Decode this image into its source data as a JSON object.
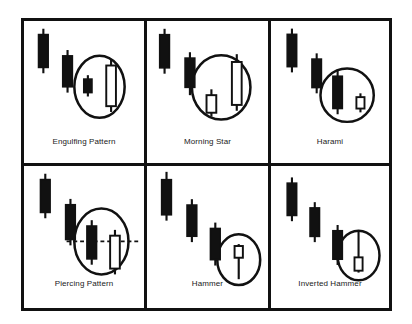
{
  "figure": {
    "background_color": "#ffffff",
    "ink_color": "#111111",
    "layout": {
      "columns": 3,
      "rows": 2,
      "cells": 6
    }
  },
  "cells": [
    {
      "id": "engulfing-pattern",
      "label": "Engulfing Pattern",
      "row": 1,
      "column": 1,
      "highlight": {
        "shape": "ellipse",
        "cx": 78,
        "cy": 68,
        "rx": 26,
        "ry": 32
      },
      "marker_line": null,
      "candles": [
        {
          "name": "candle-1",
          "color": "black",
          "x": 20,
          "body_top": 14,
          "body_bottom": 48,
          "wick_top": 8,
          "wick_bottom": 54
        },
        {
          "name": "candle-2",
          "color": "black",
          "x": 45,
          "body_top": 36,
          "body_bottom": 68,
          "wick_top": 30,
          "wick_bottom": 74
        },
        {
          "name": "candle-3",
          "color": "black",
          "x": 66,
          "body_top": 60,
          "body_bottom": 74,
          "wick_top": 56,
          "wick_bottom": 78
        },
        {
          "name": "candle-4",
          "color": "white",
          "x": 90,
          "body_top": 46,
          "body_bottom": 88,
          "wick_top": 40,
          "wick_bottom": 94
        }
      ]
    },
    {
      "id": "morning-star",
      "label": "Morning Star",
      "row": 1,
      "column": 2,
      "highlight": {
        "shape": "ellipse",
        "cx": 76,
        "cy": 68,
        "rx": 30,
        "ry": 33
      },
      "marker_line": null,
      "candles": [
        {
          "name": "candle-1",
          "color": "black",
          "x": 18,
          "body_top": 14,
          "body_bottom": 48,
          "wick_top": 8,
          "wick_bottom": 54
        },
        {
          "name": "candle-2",
          "color": "black",
          "x": 44,
          "body_top": 38,
          "body_bottom": 68,
          "wick_top": 32,
          "wick_bottom": 76
        },
        {
          "name": "candle-3",
          "color": "white",
          "x": 66,
          "body_top": 76,
          "body_bottom": 94,
          "wick_top": 70,
          "wick_bottom": 98
        },
        {
          "name": "candle-4",
          "color": "white",
          "x": 92,
          "body_top": 42,
          "body_bottom": 86,
          "wick_top": 34,
          "wick_bottom": 92
        }
      ]
    },
    {
      "id": "harami",
      "label": "Harami",
      "row": 1,
      "column": 3,
      "highlight": {
        "shape": "ellipse",
        "cx": 80,
        "cy": 78,
        "rx": 28,
        "ry": 28
      },
      "marker_line": null,
      "candles": [
        {
          "name": "candle-1",
          "color": "black",
          "x": 22,
          "body_top": 14,
          "body_bottom": 48,
          "wick_top": 8,
          "wick_bottom": 54
        },
        {
          "name": "candle-2",
          "color": "black",
          "x": 48,
          "body_top": 40,
          "body_bottom": 70,
          "wick_top": 34,
          "wick_bottom": 76
        },
        {
          "name": "candle-3",
          "color": "black",
          "x": 70,
          "body_top": 58,
          "body_bottom": 92,
          "wick_top": 52,
          "wick_bottom": 98
        },
        {
          "name": "candle-4",
          "color": "white",
          "x": 94,
          "body_top": 80,
          "body_bottom": 92,
          "wick_top": 76,
          "wick_bottom": 96
        }
      ]
    },
    {
      "id": "piercing-pattern",
      "label": "Piercing Pattern",
      "row": 2,
      "column": 1,
      "highlight": {
        "shape": "ellipse",
        "cx": 80,
        "cy": 78,
        "rx": 28,
        "ry": 34
      },
      "marker_line": {
        "type": "dashed-horizontal",
        "y": 78,
        "x_start": 44,
        "x_end": 120
      },
      "candles": [
        {
          "name": "candle-1",
          "color": "black",
          "x": 22,
          "body_top": 14,
          "body_bottom": 48,
          "wick_top": 8,
          "wick_bottom": 54
        },
        {
          "name": "candle-2",
          "color": "black",
          "x": 48,
          "body_top": 40,
          "body_bottom": 76,
          "wick_top": 34,
          "wick_bottom": 82
        },
        {
          "name": "candle-3",
          "color": "black",
          "x": 70,
          "body_top": 62,
          "body_bottom": 96,
          "wick_top": 56,
          "wick_bottom": 102
        },
        {
          "name": "candle-4",
          "color": "white",
          "x": 94,
          "body_top": 72,
          "body_bottom": 106,
          "wick_top": 66,
          "wick_bottom": 112
        }
      ]
    },
    {
      "id": "hammer",
      "label": "Hammer",
      "row": 2,
      "column": 2,
      "highlight": {
        "shape": "ellipse",
        "cx": 94,
        "cy": 96,
        "rx": 22,
        "ry": 26
      },
      "marker_line": null,
      "candles": [
        {
          "name": "candle-1",
          "color": "black",
          "x": 20,
          "body_top": 14,
          "body_bottom": 50,
          "wick_top": 6,
          "wick_bottom": 56
        },
        {
          "name": "candle-2",
          "color": "black",
          "x": 46,
          "body_top": 40,
          "body_bottom": 72,
          "wick_top": 34,
          "wick_bottom": 78
        },
        {
          "name": "candle-3",
          "color": "black",
          "x": 70,
          "body_top": 64,
          "body_bottom": 96,
          "wick_top": 58,
          "wick_bottom": 102
        },
        {
          "name": "candle-4",
          "color": "white",
          "x": 94,
          "body_top": 82,
          "body_bottom": 94,
          "wick_top": 80,
          "wick_bottom": 116
        }
      ]
    },
    {
      "id": "inverted-hammer",
      "label": "Inverted Hammer",
      "row": 2,
      "column": 3,
      "highlight": {
        "shape": "ellipse",
        "cx": 92,
        "cy": 94,
        "rx": 22,
        "ry": 26
      },
      "marker_line": null,
      "candles": [
        {
          "name": "candle-1",
          "color": "black",
          "x": 22,
          "body_top": 18,
          "body_bottom": 52,
          "wick_top": 12,
          "wick_bottom": 58
        },
        {
          "name": "candle-2",
          "color": "black",
          "x": 46,
          "body_top": 44,
          "body_bottom": 74,
          "wick_top": 38,
          "wick_bottom": 80
        },
        {
          "name": "candle-3",
          "color": "black",
          "x": 70,
          "body_top": 68,
          "body_bottom": 98,
          "wick_top": 62,
          "wick_bottom": 104
        },
        {
          "name": "candle-4",
          "color": "white",
          "x": 92,
          "body_top": 96,
          "body_bottom": 110,
          "wick_top": 68,
          "wick_bottom": 112
        }
      ]
    }
  ]
}
